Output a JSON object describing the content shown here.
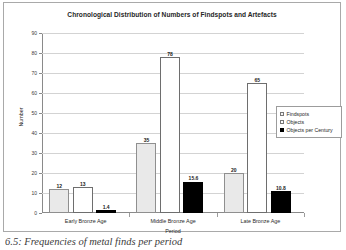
{
  "figure": {
    "caption": "6.5: Frequencies of metal finds per period"
  },
  "chart_data": {
    "type": "bar",
    "title": "Chronological Distribution of Numbers of Findspots and Artefacts",
    "xlabel": "Period",
    "ylabel": "Number",
    "ylim": [
      0,
      90
    ],
    "ytick_step": 10,
    "yticks": [
      "90",
      "80",
      "70",
      "60",
      "50",
      "40",
      "30",
      "20",
      "10",
      "0"
    ],
    "grid": true,
    "legend_position": "right",
    "categories": [
      "Early Bronze Age",
      "Middle Bronze Age",
      "Late Bronze Age"
    ],
    "series": [
      {
        "name": "Findspots",
        "key": "findspots",
        "color": "#e9e9e9",
        "values": [
          12,
          35,
          20
        ],
        "labels": [
          "12",
          "35",
          "20"
        ]
      },
      {
        "name": "Objects",
        "key": "objects",
        "color": "#ffffff",
        "values": [
          13,
          78,
          65
        ],
        "labels": [
          "13",
          "78",
          "65"
        ]
      },
      {
        "name": "Objects per Century",
        "key": "perCentury",
        "color": "#000000",
        "values": [
          1.4,
          15.6,
          10.8
        ],
        "labels": [
          "1.4",
          "15.6",
          "10.8"
        ]
      }
    ]
  }
}
